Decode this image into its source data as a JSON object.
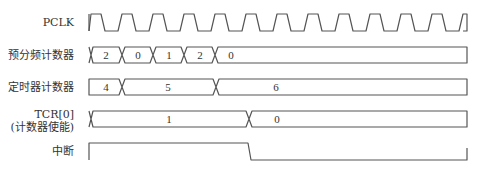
{
  "diagram": {
    "type": "timing-diagram",
    "colors": {
      "line": "#555555",
      "text": "#333333",
      "background": "#ffffff"
    },
    "signals": [
      {
        "id": "pclk",
        "label": "PCLK",
        "kind": "clock",
        "cycles": 12
      },
      {
        "id": "prescaler",
        "label": "预分频计数器",
        "kind": "bus",
        "values": [
          "2",
          "0",
          "1",
          "2",
          "0"
        ]
      },
      {
        "id": "timer",
        "label": "定时器计数器",
        "kind": "bus",
        "values": [
          "4",
          "5",
          "6"
        ]
      },
      {
        "id": "tcr0",
        "label_line1": "TCR[0]",
        "label_line2": "(计数器使能)",
        "kind": "bus",
        "values": [
          "1",
          "0"
        ]
      },
      {
        "id": "interrupt",
        "label": "中断",
        "kind": "digital",
        "levels": [
          "high",
          "low"
        ]
      }
    ]
  }
}
